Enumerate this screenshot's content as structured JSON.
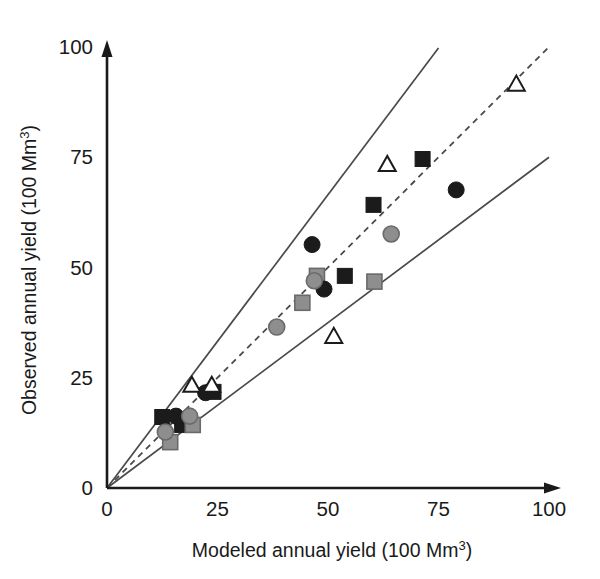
{
  "chart_data": {
    "type": "scatter",
    "title": "",
    "xlabel": "Modeled annual yield (100 Mm³)",
    "ylabel": "Observed annual yield (100 Mm³)",
    "xlabel_text": "Modeled annual yield (100 Mm",
    "ylabel_text": "Observed annual yield (100 Mm",
    "label_suffix": ")",
    "superscript": "3",
    "xlim": [
      0,
      100
    ],
    "ylim": [
      0,
      100
    ],
    "xticks": [
      0,
      25,
      50,
      75,
      100
    ],
    "yticks": [
      0,
      25,
      50,
      75,
      100
    ],
    "xtick_labels": [
      "0",
      "25",
      "50",
      "75",
      "100"
    ],
    "ytick_labels": [
      "0",
      "25",
      "50",
      "75",
      "100"
    ],
    "grid": false,
    "legend": "none",
    "axis_style": "arrow-ended L-axes",
    "reference_lines": [
      {
        "name": "upper-bound-line",
        "style": "solid",
        "slope": 1.33,
        "intercept": 0,
        "x_range": [
          0,
          75
        ]
      },
      {
        "name": "one-to-one-line",
        "style": "dashed",
        "slope": 1.0,
        "intercept": 0,
        "x_range": [
          0,
          100
        ]
      },
      {
        "name": "lower-bound-line",
        "style": "solid",
        "slope": 0.75,
        "intercept": 0,
        "x_range": [
          0,
          100
        ]
      }
    ],
    "series": [
      {
        "name": "black-squares",
        "marker": "square",
        "fill": "#1b1b1b",
        "edge": "#1b1b1b",
        "points": [
          {
            "x": 12.5,
            "y": 16.1
          },
          {
            "x": 17.0,
            "y": 14.3
          },
          {
            "x": 24.1,
            "y": 21.8
          },
          {
            "x": 53.8,
            "y": 48.1
          },
          {
            "x": 60.3,
            "y": 64.2
          },
          {
            "x": 71.4,
            "y": 74.6
          }
        ]
      },
      {
        "name": "gray-squares",
        "marker": "square",
        "fill": "#8e8e8e",
        "edge": "#6a6a6a",
        "points": [
          {
            "x": 14.3,
            "y": 10.4
          },
          {
            "x": 19.4,
            "y": 14.3
          },
          {
            "x": 44.2,
            "y": 42.0
          },
          {
            "x": 47.5,
            "y": 48.1
          },
          {
            "x": 60.5,
            "y": 46.8
          }
        ]
      },
      {
        "name": "black-circles",
        "marker": "circle",
        "fill": "#1b1b1b",
        "edge": "#1b1b1b",
        "points": [
          {
            "x": 15.6,
            "y": 16.3
          },
          {
            "x": 22.3,
            "y": 21.6
          },
          {
            "x": 46.4,
            "y": 55.2
          },
          {
            "x": 49.1,
            "y": 45.1
          },
          {
            "x": 79.0,
            "y": 67.6
          }
        ]
      },
      {
        "name": "gray-circles",
        "marker": "circle",
        "fill": "#8e8e8e",
        "edge": "#6a6a6a",
        "points": [
          {
            "x": 13.2,
            "y": 12.7
          },
          {
            "x": 18.7,
            "y": 16.3
          },
          {
            "x": 38.4,
            "y": 36.5
          },
          {
            "x": 46.9,
            "y": 47.0
          },
          {
            "x": 64.3,
            "y": 57.6
          }
        ]
      },
      {
        "name": "open-triangles",
        "marker": "triangle",
        "fill": "#ffffff",
        "edge": "#1b1b1b",
        "points": [
          {
            "x": 19.2,
            "y": 23.1
          },
          {
            "x": 23.7,
            "y": 23.1
          },
          {
            "x": 51.3,
            "y": 34.2
          },
          {
            "x": 63.4,
            "y": 73.2
          },
          {
            "x": 92.6,
            "y": 91.4
          }
        ]
      }
    ]
  }
}
